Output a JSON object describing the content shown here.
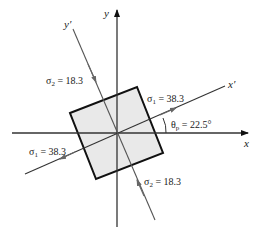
{
  "diagram": {
    "axes": {
      "x_label": "x",
      "y_label": "y",
      "x_prime_label": "x′",
      "y_prime_label": "y′"
    },
    "stresses": {
      "sigma1_top": {
        "symbol": "σ",
        "sub": "1",
        "text": " = 38.3"
      },
      "sigma1_left": {
        "symbol": "σ",
        "sub": "1",
        "text": " = 38.3"
      },
      "sigma2_top": {
        "symbol": "σ",
        "sub": "2",
        "text": " = 18.3"
      },
      "sigma2_bottom": {
        "symbol": "σ",
        "sub": "2",
        "text": " = 18.3"
      }
    },
    "angle": {
      "symbol": "θ",
      "sub": "p",
      "text": " = 22.5°"
    },
    "colors": {
      "element_fill": "#e8e8e8",
      "element_stroke": "#111111",
      "axis": "#222222",
      "rotated_axis": "#555555"
    }
  }
}
